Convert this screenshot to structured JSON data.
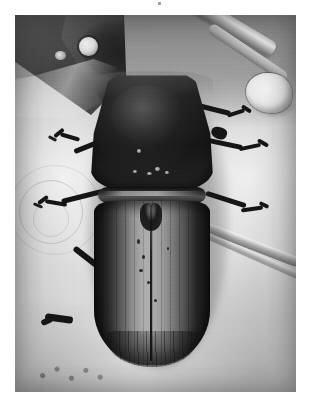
{
  "page": {
    "background_color": "#ffffff",
    "width": 309,
    "height": 417,
    "caption": ""
  },
  "figure": {
    "type": "photograph",
    "rendering": "black-and-white halftone print scan",
    "plate": {
      "left": 15,
      "top": 15,
      "width": 281,
      "height": 377,
      "border_color": "#8e8c88"
    },
    "palette": {
      "darkest": "#1a1918",
      "body_dark": "#262423",
      "body_mid": "#6d6a65",
      "elytra_light": "#a3a099",
      "substrate_light": "#e9e7e2",
      "substrate_mid": "#c8c6c0",
      "substrate_dark": "#8e8c88",
      "paper_white": "#ffffff"
    },
    "regions": [
      {
        "name": "top-left-dark-wedge",
        "description": "dark angular object with a small bright circular highlight"
      },
      {
        "name": "top-right-grain",
        "description": "diagonal woody grain lines and a pale rounded blob"
      },
      {
        "name": "left-background-rings",
        "description": "faint concentric ring impressions on the pale surface"
      },
      {
        "name": "bottom-right-groove",
        "description": "diagonal bright-edged groove across the lower right"
      },
      {
        "name": "bottom-debris",
        "description": "scattered small dark specks along the lower left edge"
      }
    ],
    "anatomy": [
      {
        "name": "pronotum",
        "label": "pronotum"
      },
      {
        "name": "elytra",
        "label": "elytra"
      },
      {
        "name": "suture",
        "label": "elytral suture"
      },
      {
        "name": "striae",
        "label": "longitudinal striae"
      },
      {
        "name": "legs",
        "label": "legs",
        "count": 6
      }
    ]
  }
}
